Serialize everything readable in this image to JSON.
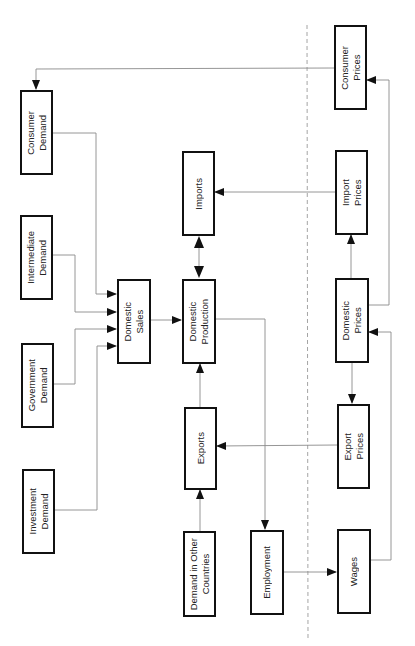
{
  "diagram": {
    "type": "flowchart",
    "orientation": "rotated-90-ccw",
    "nodes": {
      "consumer_demand": "Consumer\nDemand",
      "intermediate_demand": "Intermediate\nDemand",
      "government_demand": "Government\nDemand",
      "investment_demand": "Investment\nDemand",
      "domestic_sales": "Domestic\nSales",
      "imports": "Imports",
      "domestic_production": "Domestic\nProduction",
      "exports": "Exports",
      "demand_other_countries": "Demand in Other\nCountries",
      "employment": "Employment",
      "consumer_prices": "Consumer\nPrices",
      "import_prices": "Import\nPrices",
      "domestic_prices": "Domestic\nPrices",
      "export_prices": "Export\nPrices",
      "wages": "Wages"
    },
    "edges": [
      {
        "from": "Consumer Prices",
        "to": "Consumer Demand"
      },
      {
        "from": "Consumer Demand",
        "to": "Domestic Sales"
      },
      {
        "from": "Intermediate Demand",
        "to": "Domestic Sales"
      },
      {
        "from": "Government Demand",
        "to": "Domestic Sales"
      },
      {
        "from": "Investment Demand",
        "to": "Domestic Sales"
      },
      {
        "from": "Domestic Sales",
        "to": "Domestic Production"
      },
      {
        "from": "Imports",
        "to": "Domestic Production",
        "bidirectional": true
      },
      {
        "from": "Exports",
        "to": "Domestic Production"
      },
      {
        "from": "Demand in Other Countries",
        "to": "Exports"
      },
      {
        "from": "Domestic Production",
        "to": "Employment"
      },
      {
        "from": "Employment",
        "to": "Wages"
      },
      {
        "from": "Wages",
        "to": "Domestic Prices"
      },
      {
        "from": "Domestic Prices",
        "to": "Import Prices"
      },
      {
        "from": "Domestic Prices",
        "to": "Export Prices"
      },
      {
        "from": "Domestic Prices",
        "to": "Consumer Prices"
      },
      {
        "from": "Import Prices",
        "to": "Imports"
      },
      {
        "from": "Export Prices",
        "to": "Exports"
      }
    ],
    "divider": "dashed vertical line separating quantity block from price block"
  },
  "colors": {
    "box_border": "#111111",
    "wire": "#8a8a8a",
    "arrowhead": "#111111",
    "divider": "#9a9a9a"
  }
}
